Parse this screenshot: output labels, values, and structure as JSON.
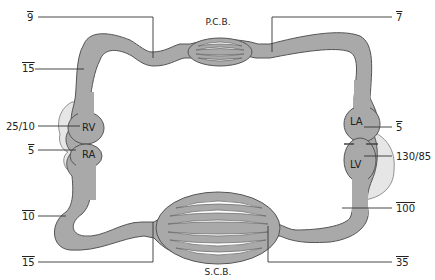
{
  "diagram": {
    "beds": {
      "pulmonary": "P.C.B.",
      "systemic": "S.C.B."
    },
    "chambers": {
      "rv": "RV",
      "ra": "RA",
      "la": "LA",
      "lv": "LV"
    },
    "pressures": {
      "pulmonary_artery": "9",
      "pulmonary_artery_left": "15",
      "pulmonary_vein": "7",
      "rv": "25/10",
      "ra": "5",
      "la": "5",
      "lv": "130/85",
      "vena_cava": "10",
      "systemic_venous": "15",
      "aorta": "100",
      "systemic_arterial": "35"
    },
    "colors": {
      "vessel": "#a9a9a9",
      "outline": "#555555",
      "myocardium": "#e6e6e6"
    }
  }
}
